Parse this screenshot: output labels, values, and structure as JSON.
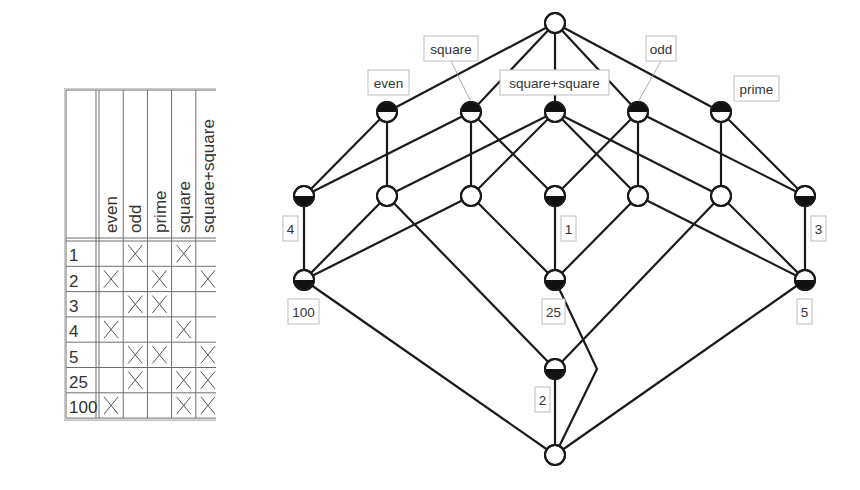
{
  "context_table": {
    "attributes": [
      "even",
      "odd",
      "prime",
      "square",
      "square+square"
    ],
    "objects": [
      "1",
      "2",
      "3",
      "4",
      "5",
      "25",
      "100"
    ],
    "incidence": [
      [
        false,
        true,
        false,
        true,
        false
      ],
      [
        true,
        false,
        true,
        false,
        true
      ],
      [
        false,
        true,
        true,
        false,
        false
      ],
      [
        true,
        false,
        false,
        true,
        false
      ],
      [
        false,
        true,
        true,
        false,
        true
      ],
      [
        false,
        true,
        false,
        true,
        true
      ],
      [
        true,
        false,
        false,
        true,
        true
      ]
    ],
    "mark": "×"
  },
  "lattice": {
    "colors": {
      "line": "#1a1a1a",
      "fill": "#ffffff",
      "filled": "#111111",
      "label_border": "#bdbdbd",
      "leader": "#999999"
    },
    "nodes": [
      {
        "id": "top",
        "x": 555,
        "y": 23,
        "attr": false,
        "obj": false
      },
      {
        "id": "even",
        "x": 387,
        "y": 112,
        "attr": true,
        "obj": false
      },
      {
        "id": "square",
        "x": 471,
        "y": 112,
        "attr": true,
        "obj": false
      },
      {
        "id": "ss",
        "x": 555,
        "y": 112,
        "attr": true,
        "obj": false
      },
      {
        "id": "odd",
        "x": 638,
        "y": 112,
        "attr": true,
        "obj": false
      },
      {
        "id": "prime",
        "x": 721,
        "y": 112,
        "attr": true,
        "obj": false
      },
      {
        "id": "n4",
        "x": 304,
        "y": 196,
        "attr": false,
        "obj": true
      },
      {
        "id": "b",
        "x": 387,
        "y": 196,
        "attr": false,
        "obj": false
      },
      {
        "id": "c",
        "x": 471,
        "y": 196,
        "attr": false,
        "obj": false
      },
      {
        "id": "n1",
        "x": 555,
        "y": 196,
        "attr": false,
        "obj": true
      },
      {
        "id": "e",
        "x": 638,
        "y": 196,
        "attr": false,
        "obj": false
      },
      {
        "id": "f",
        "x": 721,
        "y": 196,
        "attr": false,
        "obj": false
      },
      {
        "id": "n3",
        "x": 805,
        "y": 196,
        "attr": false,
        "obj": true
      },
      {
        "id": "n100",
        "x": 304,
        "y": 280,
        "attr": false,
        "obj": true
      },
      {
        "id": "n25",
        "x": 555,
        "y": 280,
        "attr": false,
        "obj": true
      },
      {
        "id": "n5",
        "x": 805,
        "y": 280,
        "attr": false,
        "obj": true
      },
      {
        "id": "n2",
        "x": 555,
        "y": 369,
        "attr": false,
        "obj": true
      },
      {
        "id": "bottom",
        "x": 555,
        "y": 455,
        "attr": false,
        "obj": false
      }
    ],
    "edges": [
      [
        "top",
        "even"
      ],
      [
        "top",
        "square"
      ],
      [
        "top",
        "ss"
      ],
      [
        "top",
        "odd"
      ],
      [
        "top",
        "prime"
      ],
      [
        "even",
        "n4"
      ],
      [
        "even",
        "b"
      ],
      [
        "square",
        "n4"
      ],
      [
        "square",
        "c"
      ],
      [
        "square",
        "n1"
      ],
      [
        "ss",
        "b"
      ],
      [
        "ss",
        "c"
      ],
      [
        "ss",
        "e"
      ],
      [
        "ss",
        "f"
      ],
      [
        "odd",
        "n1"
      ],
      [
        "odd",
        "e"
      ],
      [
        "odd",
        "n3"
      ],
      [
        "prime",
        "f"
      ],
      [
        "prime",
        "n3"
      ],
      [
        "n4",
        "n100"
      ],
      [
        "b",
        "n100"
      ],
      [
        "c",
        "n100"
      ],
      [
        "b",
        "n2"
      ],
      [
        "c",
        "n25"
      ],
      [
        "n1",
        "n25"
      ],
      [
        "e",
        "n25"
      ],
      [
        "e",
        "n5"
      ],
      [
        "f",
        "n5"
      ],
      [
        "n3",
        "n5"
      ],
      [
        "f",
        "n2"
      ],
      [
        "n100",
        "bottom"
      ],
      [
        "n2",
        "bottom"
      ],
      [
        "n5",
        "bottom"
      ]
    ],
    "bent_edges": [
      {
        "from": "n25",
        "to": "bottom",
        "via": [
          597,
          369
        ]
      }
    ],
    "attribute_labels": [
      {
        "text": "even",
        "node": "even",
        "x": 368,
        "y": 70,
        "w": 41,
        "h": 25,
        "leader": false
      },
      {
        "text": "square",
        "node": "square",
        "x": 424,
        "y": 36,
        "w": 54,
        "h": 25,
        "leader": true
      },
      {
        "text": "square+square",
        "node": "ss",
        "x": 500,
        "y": 70,
        "w": 109,
        "h": 25,
        "leader": false
      },
      {
        "text": "odd",
        "node": "odd",
        "x": 646,
        "y": 36,
        "w": 30,
        "h": 25,
        "leader": true
      },
      {
        "text": "prime",
        "node": "prime",
        "x": 734,
        "y": 76,
        "w": 45,
        "h": 25,
        "leader": false
      }
    ],
    "object_labels": [
      {
        "text": "4",
        "node": "n4",
        "x": 283,
        "y": 216,
        "w": 15,
        "h": 25
      },
      {
        "text": "1",
        "node": "n1",
        "x": 561,
        "y": 216,
        "w": 15,
        "h": 25
      },
      {
        "text": "3",
        "node": "n3",
        "x": 811,
        "y": 216,
        "w": 15,
        "h": 25
      },
      {
        "text": "100",
        "node": "n100",
        "x": 288,
        "y": 299,
        "w": 31,
        "h": 25
      },
      {
        "text": "25",
        "node": "n25",
        "x": 542,
        "y": 299,
        "w": 23,
        "h": 25
      },
      {
        "text": "5",
        "node": "n5",
        "x": 797,
        "y": 299,
        "w": 15,
        "h": 25
      },
      {
        "text": "2",
        "node": "n2",
        "x": 535,
        "y": 387,
        "w": 15,
        "h": 25
      }
    ]
  }
}
